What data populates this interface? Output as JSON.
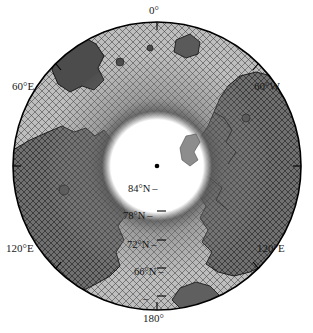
{
  "figure": {
    "type": "polar-stereographic-map",
    "region": "Arctic Ocean",
    "background_color": "#ffffff",
    "outline_color": "#000000"
  },
  "projection": {
    "center_label": "north-pole-marker",
    "center_marker_color": "#000000",
    "boundary_latitude_deg": 60,
    "inner_blank_radius_latitude_deg": 87
  },
  "longitude_labels": [
    {
      "id": "lon-0",
      "text": "0°",
      "angle_deg": 0,
      "position": "top"
    },
    {
      "id": "lon-60E",
      "text": "60°E",
      "angle_deg": 300,
      "position": "upper-left"
    },
    {
      "id": "lon-60W",
      "text": "60°W",
      "angle_deg": 60,
      "position": "upper-right"
    },
    {
      "id": "lon-120E-left",
      "text": "120°E",
      "angle_deg": 240,
      "position": "lower-left"
    },
    {
      "id": "lon-120E-right",
      "text": "120°E",
      "angle_deg": 120,
      "position": "lower-right"
    },
    {
      "id": "lon-180",
      "text": "180°",
      "angle_deg": 180,
      "position": "bottom"
    }
  ],
  "latitude_labels": [
    {
      "id": "lat-84",
      "text": "84°N",
      "tick": "–",
      "value_deg": 84
    },
    {
      "id": "lat-78",
      "text": "78°N",
      "tick": "–",
      "value_deg": 78
    },
    {
      "id": "lat-72",
      "text": "72°N",
      "tick": "–",
      "value_deg": 72
    },
    {
      "id": "lat-66",
      "text": "66°N",
      "tick": "–",
      "value_deg": 66
    },
    {
      "id": "lat-60",
      "text": "",
      "tick": "–",
      "value_deg": 60
    }
  ],
  "layers": {
    "mesh": {
      "name": "triangular-finite-element-mesh",
      "stroke_color": "#2e2e2e",
      "description": "cross-hatched triangular grid covering ocean domain"
    },
    "ocean_fill": "#c9c9c9",
    "land_fill": "#6e6e6e",
    "land_outline": "#111111",
    "polar_gap_fill": "#ffffff",
    "shading_dark": "#3a3a3a"
  },
  "colors": {
    "accent": "#000000",
    "text": "#1a1a1a",
    "ocean": "#c9c9c9",
    "land": "#6e6e6e",
    "mesh": "#2e2e2e"
  }
}
